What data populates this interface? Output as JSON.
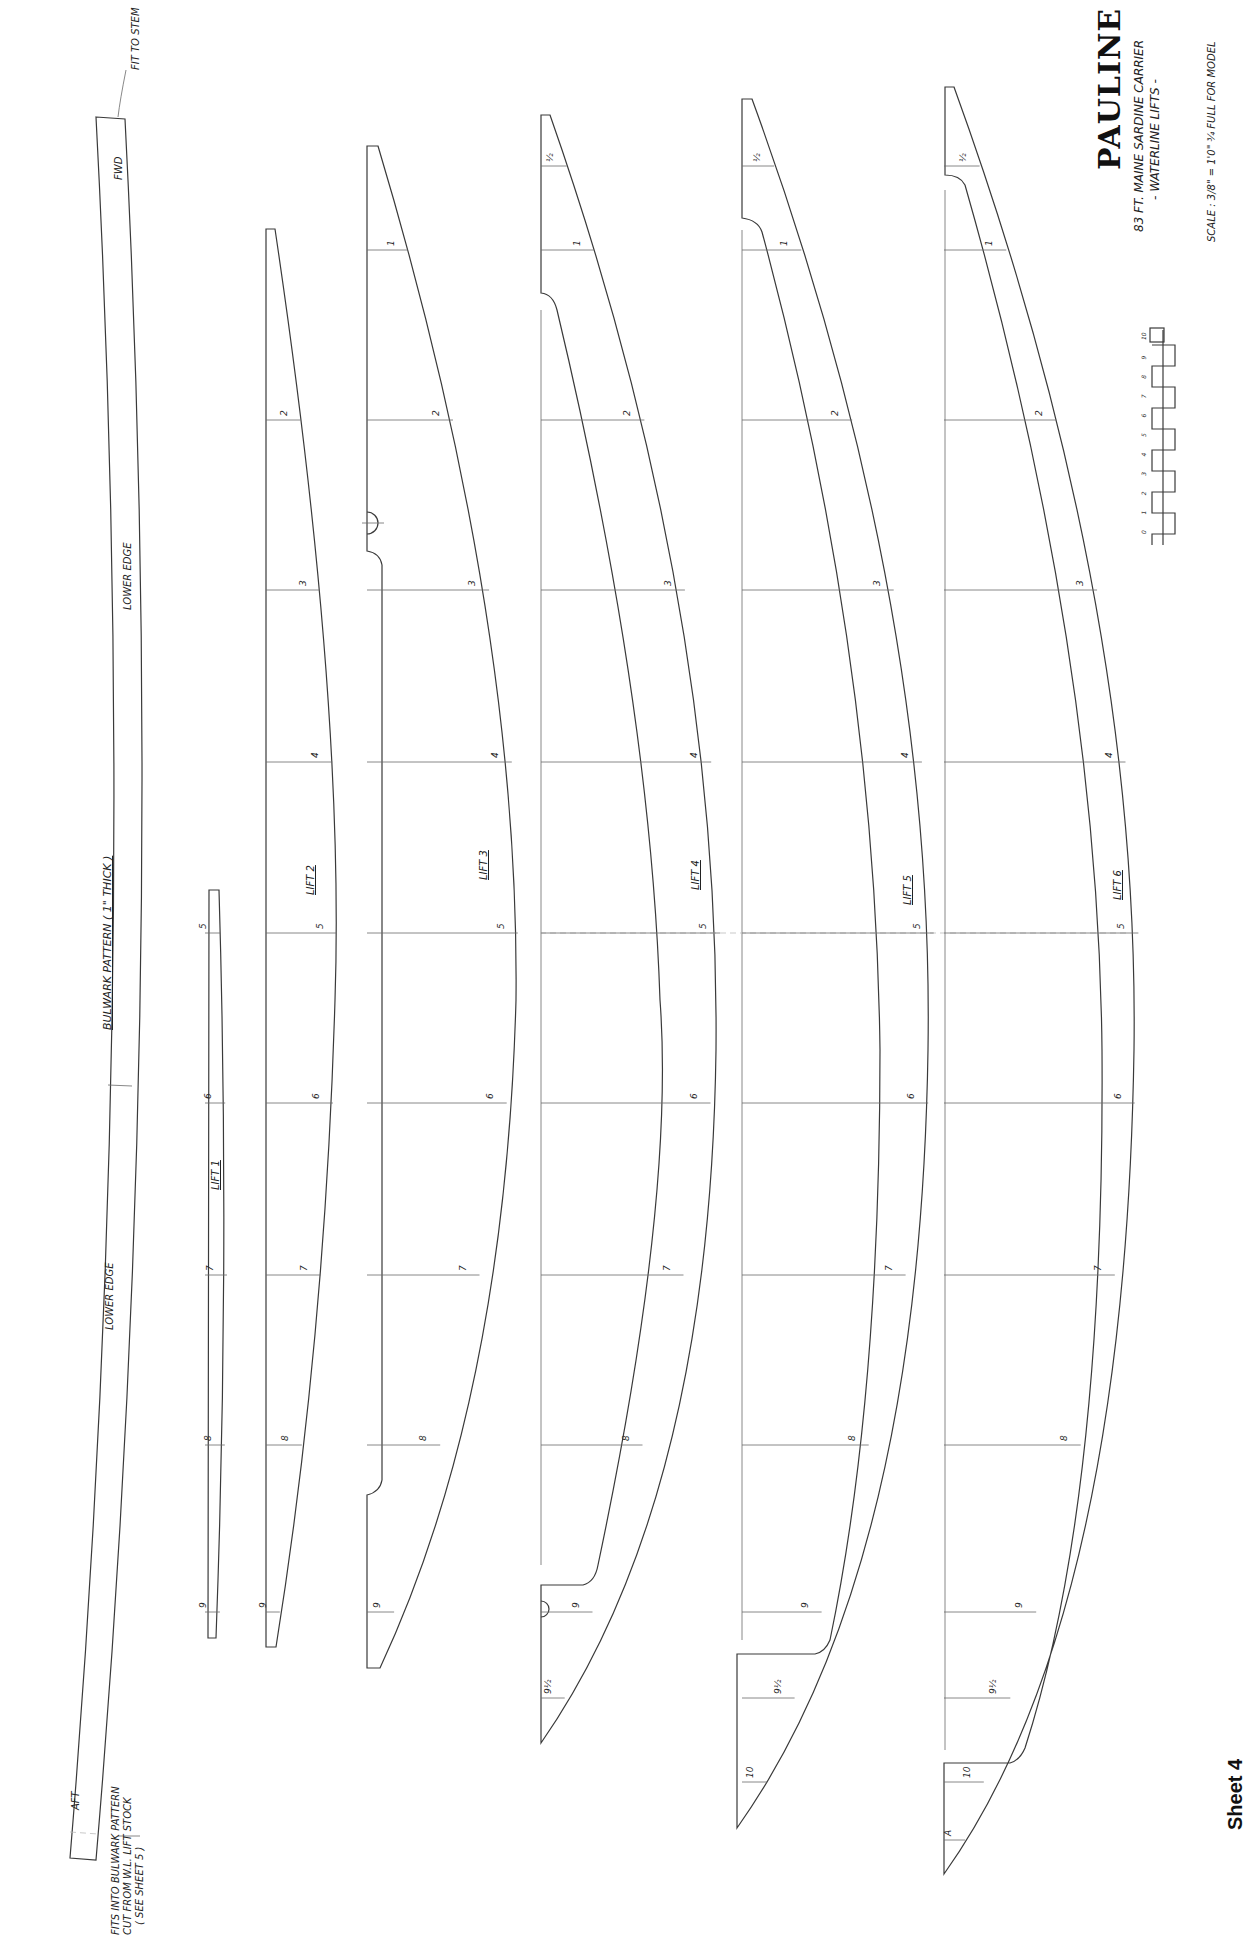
{
  "title_block": {
    "vessel_name": "PAULINE",
    "subtitle_line1": "83 FT. MAINE SARDINE CARRIER",
    "subtitle_line2": "- WATERLINE LIFTS -",
    "scale_note": "SCALE : 3/8\" = 1'0\" ¾ FULL FOR MODEL"
  },
  "sheet_label": "Sheet 4",
  "bulwark": {
    "label": "BULWARK PATTERN  ( 1\" THICK )",
    "fwd_label": "FWD",
    "aft_label": "AFT",
    "lower_edge_upper": "LOWER EDGE",
    "lower_edge_lower": "LOWER EDGE",
    "stem_note": "FIT TO STEM",
    "aft_note_line1": "FITS INTO BULWARK PATTERN",
    "aft_note_line2": "CUT FROM W.L. LIFT STOCK",
    "aft_note_line3": "( SEE SHEET 5 )"
  },
  "stations": {
    "labels": [
      "½",
      "1",
      "2",
      "3",
      "4",
      "5",
      "6",
      "7",
      "8",
      "9",
      "9½",
      "10",
      "A"
    ],
    "y": {
      "½": 166,
      "1": 250,
      "2": 420,
      "3": 590,
      "4": 762,
      "5": 933,
      "6": 1103,
      "7": 1275,
      "8": 1445,
      "9": 1612,
      "9½": 1698,
      "10": 1782,
      "A": 1840
    },
    "centerline_y": 933
  },
  "lifts": [
    {
      "id": "lift-1",
      "label": "LIFT 1",
      "left": 205,
      "top": 888,
      "bottom": 1638,
      "stations": [
        "5",
        "6",
        "7",
        "8",
        "9"
      ]
    },
    {
      "id": "lift-2",
      "label": "LIFT 2",
      "left": 266,
      "top": 229,
      "bottom": 1647,
      "stations": [
        "2",
        "3",
        "4",
        "5",
        "6",
        "7",
        "8",
        "9"
      ]
    },
    {
      "id": "lift-3",
      "label": "LIFT 3",
      "left": 367,
      "top": 146,
      "bottom": 1668,
      "stations": [
        "1",
        "2",
        "3",
        "4",
        "5",
        "6",
        "7",
        "8",
        "9"
      ]
    },
    {
      "id": "lift-4",
      "label": "LIFT 4",
      "left": 541,
      "top": 115,
      "bottom": 1743,
      "stations": [
        "½",
        "1",
        "2",
        "3",
        "4",
        "5",
        "6",
        "7",
        "8",
        "9",
        "9½"
      ]
    },
    {
      "id": "lift-5",
      "label": "LIFT 5",
      "left": 742,
      "top": 99,
      "bottom": 1828,
      "stations": [
        "½",
        "1",
        "2",
        "3",
        "4",
        "5",
        "6",
        "7",
        "8",
        "9",
        "9½",
        "10"
      ]
    },
    {
      "id": "lift-6",
      "label": "LIFT 6",
      "left": 944,
      "top": 87,
      "bottom": 1874,
      "stations": [
        "½",
        "1",
        "2",
        "3",
        "4",
        "5",
        "6",
        "7",
        "8",
        "9",
        "9½",
        "10",
        "A"
      ]
    }
  ],
  "scale_bar": {
    "ticks": [
      "0",
      "1",
      "2",
      "3",
      "4",
      "5",
      "6",
      "7",
      "8",
      "9",
      "10"
    ],
    "units": "FT"
  }
}
